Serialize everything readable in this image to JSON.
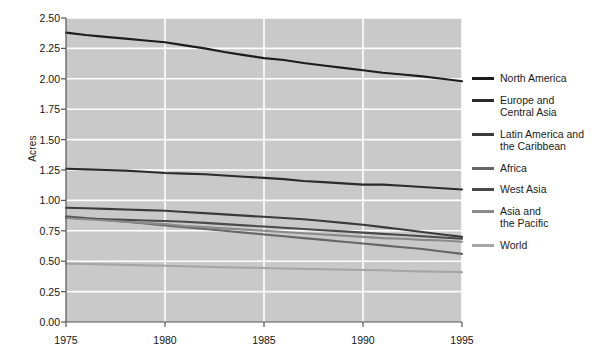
{
  "chart_data": {
    "type": "line",
    "title": "",
    "xlabel": "",
    "ylabel": "Acres",
    "xlim": [
      1975,
      1995
    ],
    "ylim": [
      0.0,
      2.5
    ],
    "grid": true,
    "legend_position": "right",
    "x_ticks": [
      "1975",
      "1980",
      "1985",
      "1990",
      "1995"
    ],
    "x_tick_values": [
      1975,
      1980,
      1985,
      1990,
      1995
    ],
    "y_ticks": [
      "0.00",
      "0.25",
      "0.50",
      "0.75",
      "1.00",
      "1.25",
      "1.50",
      "1.75",
      "2.00",
      "2.25",
      "2.50"
    ],
    "y_tick_values": [
      0.0,
      0.25,
      0.5,
      0.75,
      1.0,
      1.25,
      1.5,
      1.75,
      2.0,
      2.25,
      2.5
    ],
    "x": [
      1975,
      1976,
      1977,
      1978,
      1979,
      1980,
      1981,
      1982,
      1983,
      1984,
      1985,
      1986,
      1987,
      1988,
      1989,
      1990,
      1991,
      1992,
      1993,
      1994,
      1995
    ],
    "series": [
      {
        "name": "North America",
        "color": "#1c1c1c",
        "values": [
          2.38,
          2.36,
          2.345,
          2.33,
          2.315,
          2.3,
          2.275,
          2.25,
          2.22,
          2.195,
          2.17,
          2.155,
          2.13,
          2.11,
          2.09,
          2.07,
          2.05,
          2.035,
          2.02,
          2.0,
          1.98
        ]
      },
      {
        "name": "Europe and\nCentral Asia",
        "color": "#2b2b2b",
        "values": [
          1.26,
          1.255,
          1.25,
          1.245,
          1.235,
          1.225,
          1.22,
          1.215,
          1.205,
          1.195,
          1.185,
          1.175,
          1.16,
          1.15,
          1.14,
          1.13,
          1.13,
          1.12,
          1.11,
          1.1,
          1.09
        ]
      },
      {
        "name": "Latin America and\nthe Caribbean",
        "color": "#3a3a3a",
        "values": [
          0.94,
          0.935,
          0.93,
          0.925,
          0.92,
          0.915,
          0.905,
          0.895,
          0.885,
          0.875,
          0.865,
          0.855,
          0.845,
          0.83,
          0.815,
          0.8,
          0.78,
          0.76,
          0.74,
          0.72,
          0.7
        ]
      },
      {
        "name": "Africa",
        "color": "#666666",
        "values": [
          0.87,
          0.855,
          0.84,
          0.825,
          0.81,
          0.795,
          0.78,
          0.765,
          0.75,
          0.735,
          0.72,
          0.705,
          0.69,
          0.675,
          0.66,
          0.645,
          0.63,
          0.615,
          0.6,
          0.58,
          0.56
        ]
      },
      {
        "name": "West Asia",
        "color": "#4a4a4a",
        "values": [
          0.86,
          0.85,
          0.845,
          0.84,
          0.835,
          0.83,
          0.825,
          0.815,
          0.805,
          0.795,
          0.785,
          0.775,
          0.765,
          0.755,
          0.745,
          0.735,
          0.725,
          0.715,
          0.705,
          0.695,
          0.685
        ]
      },
      {
        "name": "Asia and\nthe Pacific",
        "color": "#8a8a8a",
        "values": [
          0.855,
          0.845,
          0.835,
          0.825,
          0.815,
          0.805,
          0.79,
          0.78,
          0.77,
          0.76,
          0.75,
          0.74,
          0.73,
          0.72,
          0.71,
          0.7,
          0.69,
          0.685,
          0.675,
          0.67,
          0.66
        ]
      },
      {
        "name": "World",
        "color": "#a6a6a6",
        "values": [
          0.48,
          0.477,
          0.474,
          0.47,
          0.466,
          0.462,
          0.458,
          0.454,
          0.45,
          0.447,
          0.444,
          0.44,
          0.437,
          0.434,
          0.431,
          0.428,
          0.425,
          0.42,
          0.416,
          0.413,
          0.41
        ]
      }
    ]
  },
  "plot": {
    "background_color": "#c9c9c9",
    "gridline_color": "#ffffff",
    "axis_color": "#555555"
  }
}
